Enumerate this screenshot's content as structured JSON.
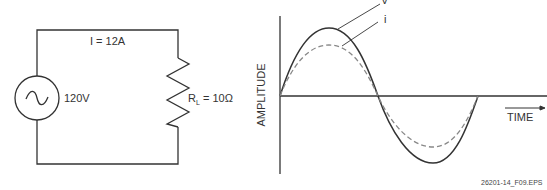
{
  "circuit": {
    "current_label": "I = 12A",
    "source_label": "120V",
    "source_icon": "ac-source-icon",
    "resistor_label_prefix": "R",
    "resistor_subscript": "L",
    "resistor_value": " = 10Ω"
  },
  "graph": {
    "y_axis_label": "AMPLITUDE",
    "x_axis_label": "TIME",
    "voltage_label": "V",
    "current_label": "i"
  },
  "figure_id": "26201-14_F09.EPS",
  "colors": {
    "line": "#333333",
    "dashed": "#888888"
  }
}
